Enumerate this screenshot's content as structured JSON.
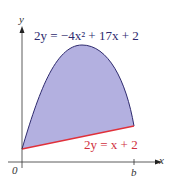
{
  "diagram": {
    "curve_label": "2y = −4x² + 17x + 2",
    "line_label": "2y = x + 2",
    "x_axis_label": "x",
    "y_axis_label": "y",
    "origin_label": "0",
    "b_label": "b",
    "colors": {
      "fill": "#b3b0e0",
      "curve": "#2e2a6e",
      "line": "#e0303a",
      "line_label": "#d03040",
      "curve_label": "#2e2a6e"
    }
  }
}
